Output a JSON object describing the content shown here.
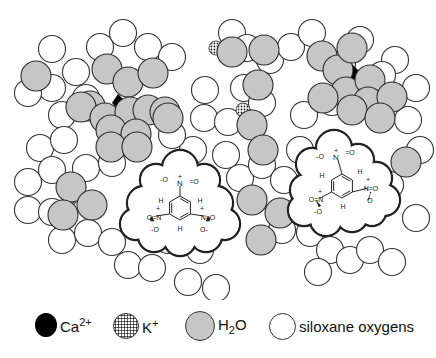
{
  "figure": {
    "molecule_label": "1,3,5-trinitrobenzene",
    "molecule_atoms": {
      "N": "N",
      "O": "O",
      "H": "H",
      "minus": "-",
      "plus": "+"
    },
    "colors": {
      "water": "#c6c6c6",
      "calcium": "#000000",
      "siloxane": "#ffffff",
      "outline": "#333333"
    },
    "siloxane_oxygens": [
      [
        52,
        49
      ],
      [
        100,
        47
      ],
      [
        123,
        33
      ],
      [
        148,
        47
      ],
      [
        172,
        57
      ],
      [
        76,
        72
      ],
      [
        52,
        88
      ],
      [
        28,
        93
      ],
      [
        62,
        115
      ],
      [
        86,
        98
      ],
      [
        40,
        148
      ],
      [
        64,
        140
      ],
      [
        28,
        182
      ],
      [
        52,
        170
      ],
      [
        86,
        168
      ],
      [
        112,
        163
      ],
      [
        28,
        210
      ],
      [
        52,
        212
      ],
      [
        62,
        240
      ],
      [
        88,
        233
      ],
      [
        112,
        242
      ],
      [
        128,
        265
      ],
      [
        152,
        268
      ],
      [
        200,
        250
      ],
      [
        216,
        288
      ],
      [
        188,
        282
      ],
      [
        168,
        240
      ],
      [
        208,
        225
      ],
      [
        205,
        90
      ],
      [
        204,
        118
      ],
      [
        232,
        33
      ],
      [
        247,
        48
      ],
      [
        270,
        60
      ],
      [
        291,
        47
      ],
      [
        312,
        33
      ],
      [
        244,
        88
      ],
      [
        262,
        103
      ],
      [
        228,
        122
      ],
      [
        226,
        155
      ],
      [
        240,
        178
      ],
      [
        262,
        165
      ],
      [
        284,
        180
      ],
      [
        282,
        230
      ],
      [
        310,
        233
      ],
      [
        330,
        250
      ],
      [
        318,
        272
      ],
      [
        350,
        260
      ],
      [
        370,
        250
      ],
      [
        392,
        262
      ],
      [
        416,
        218
      ],
      [
        390,
        185
      ],
      [
        420,
        150
      ],
      [
        408,
        120
      ],
      [
        416,
        88
      ],
      [
        395,
        60
      ],
      [
        360,
        40
      ],
      [
        382,
        75
      ],
      [
        342,
        64
      ],
      [
        332,
        102
      ],
      [
        304,
        115
      ],
      [
        300,
        150
      ],
      [
        316,
        178
      ],
      [
        190,
        200
      ],
      [
        193,
        150
      ],
      [
        172,
        135
      ]
    ],
    "water_molecules": [
      [
        36,
        76
      ],
      [
        107,
        69
      ],
      [
        128,
        82
      ],
      [
        153,
        73
      ],
      [
        90,
        106
      ],
      [
        81,
        107
      ],
      [
        105,
        118
      ],
      [
        130,
        112
      ],
      [
        148,
        110
      ],
      [
        165,
        112
      ],
      [
        111,
        130
      ],
      [
        136,
        134
      ],
      [
        111,
        147
      ],
      [
        137,
        147
      ],
      [
        168,
        118
      ],
      [
        71,
        187
      ],
      [
        92,
        205
      ],
      [
        63,
        215
      ],
      [
        232,
        52
      ],
      [
        264,
        50
      ],
      [
        258,
        85
      ],
      [
        252,
        125
      ],
      [
        263,
        150
      ],
      [
        252,
        200
      ],
      [
        280,
        213
      ],
      [
        261,
        240
      ],
      [
        322,
        56
      ],
      [
        338,
        70
      ],
      [
        352,
        48
      ],
      [
        346,
        92
      ],
      [
        370,
        80
      ],
      [
        368,
        102
      ],
      [
        392,
        97
      ],
      [
        323,
        98
      ],
      [
        352,
        110
      ],
      [
        380,
        118
      ],
      [
        406,
        162
      ]
    ],
    "calcium_ions": [
      [
        119,
        103
      ],
      [
        352,
        72
      ]
    ],
    "potassium_ions": [
      [
        216,
        48
      ],
      [
        243,
        110
      ],
      [
        69,
        200
      ],
      [
        264,
        242
      ]
    ],
    "molecules": [
      {
        "cx": 180,
        "cy": 208,
        "nitro": [
          "top",
          "left",
          "right"
        ]
      },
      {
        "cx": 342,
        "cy": 186,
        "nitro": [
          "top",
          "right",
          "bottom-left"
        ]
      }
    ]
  },
  "legend": {
    "items": [
      {
        "symbol": "Ca",
        "label": "Ca",
        "sup": "2+"
      },
      {
        "symbol": "K",
        "label": "K",
        "sup": "+"
      },
      {
        "symbol": "H2O",
        "label_a": "H",
        "sub": "2",
        "label_b": "O"
      },
      {
        "symbol": "siloxane",
        "label": "siloxane oxygens"
      }
    ]
  }
}
